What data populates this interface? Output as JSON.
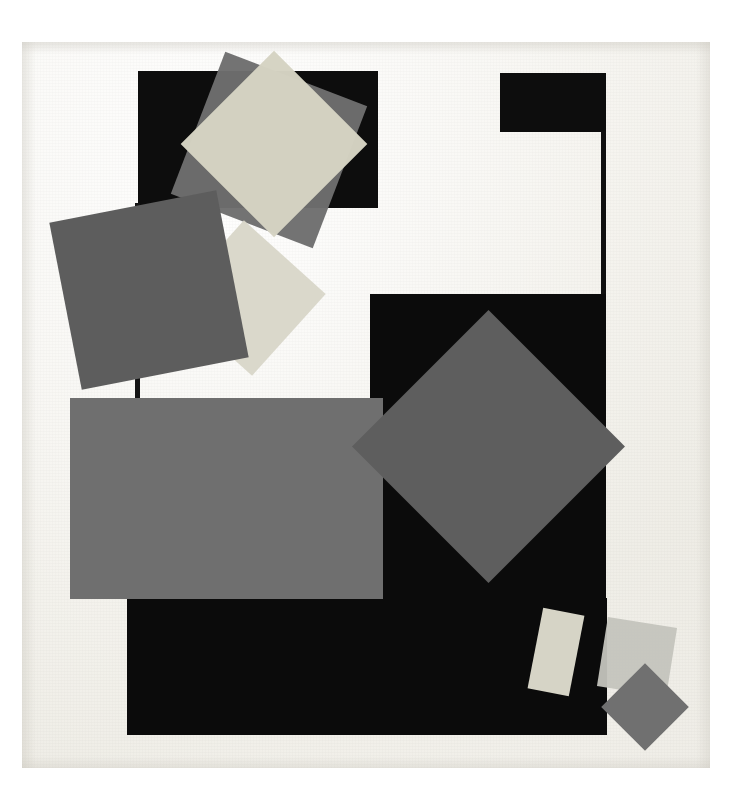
{
  "artwork": {
    "title": "Abstract geometric composition",
    "style": "Constructivist / Suprematist collage of overlapping rectangles and rotated squares",
    "canvas": {
      "width": 732,
      "height": 806,
      "background_color": "#ffffff"
    },
    "paper": {
      "label": "Aged off-white paper ground",
      "x": 22,
      "y": 42,
      "width": 688,
      "height": 726,
      "color": "#f4f2ec"
    },
    "palette": {
      "black": "#0d0d0d",
      "near_black": "#111111",
      "dark_gray": "#5a5a5a",
      "mid_gray": "#6e6e6e",
      "gray": "#737373",
      "light_gray": "#b9b9b4",
      "pale_gray": "#c9c9c4",
      "cream": "#d9d7c9",
      "pale_cream": "#dedccf",
      "white": "#ffffff"
    },
    "shapes": [
      {
        "id": "top-left-black-rectangle",
        "name": "black rectangle, upper left",
        "form": "rectangle",
        "color": "#0d0d0d",
        "x": 138,
        "y": 71,
        "width": 240,
        "height": 137,
        "rotation": 0,
        "z": 10
      },
      {
        "id": "top-left-gray-square",
        "name": "gray square rotated, inside upper black rectangle",
        "form": "square",
        "color": "#6e6e6e",
        "x": 193,
        "y": 74,
        "width": 152,
        "height": 152,
        "rotation": 21,
        "opacity": 0.97,
        "z": 20
      },
      {
        "id": "top-left-cream-diamond",
        "name": "pale cream diamond, inside upper black rectangle",
        "form": "square",
        "color": "#d5d3c3",
        "x": 208,
        "y": 78,
        "width": 132,
        "height": 132,
        "rotation": 45,
        "opacity": 0.98,
        "z": 30
      },
      {
        "id": "top-right-black-rectangle",
        "name": "small black rectangle, upper right",
        "form": "rectangle",
        "color": "#0d0d0d",
        "x": 500,
        "y": 73,
        "width": 106,
        "height": 59,
        "rotation": 0,
        "z": 10
      },
      {
        "id": "right-vertical-line",
        "name": "thin vertical black line descending from upper right rectangle",
        "form": "line",
        "color": "#101010",
        "x": 601,
        "y": 131,
        "width": 5,
        "height": 165,
        "rotation": 0,
        "z": 11
      },
      {
        "id": "left-vertical-line",
        "name": "thin vertical black line under upper left rectangle",
        "form": "line",
        "color": "#141414",
        "x": 135,
        "y": 203,
        "width": 5,
        "height": 198,
        "rotation": 0,
        "z": 11
      },
      {
        "id": "left-cream-diamond",
        "name": "pale cream diamond, middle left",
        "form": "square",
        "color": "#d8d6c8",
        "x": 193,
        "y": 243,
        "width": 110,
        "height": 110,
        "rotation": 42,
        "opacity": 0.95,
        "z": 25
      },
      {
        "id": "left-dark-gray-square",
        "name": "dark gray square rotated, middle left",
        "form": "square",
        "color": "#5d5d5d",
        "x": 64,
        "y": 205,
        "width": 170,
        "height": 170,
        "rotation": -11,
        "z": 40
      },
      {
        "id": "center-large-black-rectangle",
        "name": "large black rectangle, center right",
        "form": "rectangle",
        "color": "#0b0b0b",
        "x": 370,
        "y": 294,
        "width": 236,
        "height": 441,
        "rotation": 0,
        "z": 12
      },
      {
        "id": "bottom-black-rectangle",
        "name": "black rectangle, lower band",
        "form": "rectangle",
        "color": "#0b0b0b",
        "x": 127,
        "y": 598,
        "width": 480,
        "height": 137,
        "rotation": 0,
        "z": 13
      },
      {
        "id": "large-gray-rectangle",
        "name": "large gray rectangle, center left",
        "form": "rectangle",
        "color": "#6f6f6f",
        "x": 70,
        "y": 398,
        "width": 313,
        "height": 201,
        "rotation": 0,
        "z": 45
      },
      {
        "id": "center-gray-diamond",
        "name": "large gray diamond, center right",
        "form": "square",
        "color": "#5e5e5e",
        "x": 392,
        "y": 350,
        "width": 193,
        "height": 193,
        "rotation": 45,
        "z": 50
      },
      {
        "id": "bottom-cream-bar",
        "name": "pale cream tilted bar, lower right",
        "form": "rectangle",
        "color": "#d6d4c6",
        "x": 535,
        "y": 611,
        "width": 42,
        "height": 82,
        "rotation": 11,
        "z": 55
      },
      {
        "id": "bottom-light-square",
        "name": "light gray square rotated, lower right",
        "form": "square",
        "color": "#c4c4bd",
        "x": 602,
        "y": 622,
        "width": 70,
        "height": 70,
        "rotation": 9,
        "opacity": 0.95,
        "z": 52
      },
      {
        "id": "bottom-gray-diamond",
        "name": "gray diamond, lower right corner",
        "form": "square",
        "color": "#707070",
        "x": 614,
        "y": 676,
        "width": 62,
        "height": 62,
        "rotation": 45,
        "z": 60
      }
    ]
  }
}
